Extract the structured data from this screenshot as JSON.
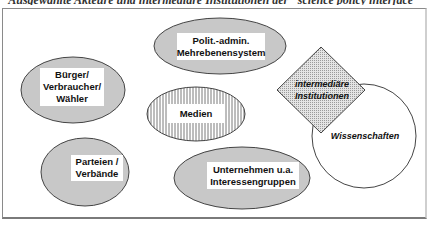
{
  "caption": "Ausgewählte Akteure und intermediäre Institutionen der \"science policy interface\"",
  "colors": {
    "ellipse_fill": "#c8c8c8",
    "stroke": "#444444",
    "label_bg": "#ffffff",
    "hatch": "#7a7a7a",
    "dot": "#9a9a9a"
  },
  "nodes": {
    "politik": {
      "line1": "Polit.-admin.",
      "line2": "Mehrebenensystem",
      "shape": "ellipse"
    },
    "buerger": {
      "line1": "Bürger/",
      "line2": "Verbraucher/",
      "line3": "Wähler",
      "shape": "ellipse"
    },
    "medien": {
      "line1": "Medien",
      "shape": "hatched-ellipse"
    },
    "parteien": {
      "line1": "Parteien /",
      "line2": "Verbände",
      "shape": "ellipse"
    },
    "unternehmen": {
      "line1": "Unternehmen u.a.",
      "line2": "Interessengruppen",
      "shape": "ellipse"
    },
    "intermediaere": {
      "line1": "intermediäre",
      "line2": "Institutionen",
      "shape": "dotted-diamond"
    },
    "wissenschaften": {
      "line1": "Wissenschaften",
      "shape": "circle"
    }
  }
}
